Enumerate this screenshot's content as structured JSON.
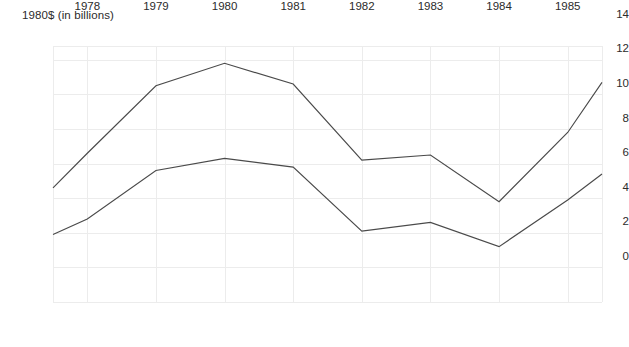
{
  "chart": {
    "axis_title": "1980$ (in billions)",
    "x_tick_labels": [
      "1978",
      "1979",
      "1980",
      "1981",
      "1982",
      "1983",
      "1984",
      "1985"
    ],
    "y_tick_labels": [
      "14",
      "12",
      "10",
      "8",
      "6",
      "4",
      "2",
      "0"
    ],
    "line_color": "#4a4a4a",
    "grid_color": "#ececec",
    "background_color": "#ffffff"
  },
  "chart_data": {
    "type": "line",
    "title": "",
    "xlabel": "",
    "ylabel": "1980$ (in billions)",
    "xlim": [
      1977.5,
      1985.5
    ],
    "ylim": [
      0,
      14.8
    ],
    "yticks": [
      0,
      2,
      4,
      6,
      8,
      10,
      12,
      14
    ],
    "xticks": [
      1978,
      1979,
      1980,
      1981,
      1982,
      1983,
      1984,
      1985
    ],
    "grid": true,
    "legend": "none",
    "x": [
      1977.5,
      1978,
      1979,
      1980,
      1981,
      1982,
      1983,
      1984,
      1985,
      1985.5
    ],
    "series": [
      {
        "name": "upper",
        "values": [
          6.6,
          8.6,
          12.5,
          13.8,
          12.6,
          8.2,
          8.5,
          5.8,
          9.8,
          12.7
        ]
      },
      {
        "name": "lower",
        "values": [
          3.9,
          4.8,
          7.6,
          8.3,
          7.8,
          4.1,
          4.6,
          3.2,
          5.9,
          7.4
        ]
      }
    ]
  }
}
